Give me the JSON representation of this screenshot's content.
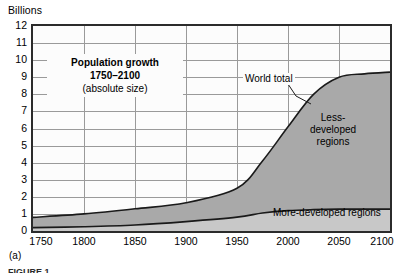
{
  "figure": {
    "unit_label": "Billions",
    "subfigure_label": "(a)",
    "cut_caption": "FIGURE 1"
  },
  "chart_data": {
    "type": "area",
    "title": "Population growth 1750–2100 (absolute size)",
    "title_lines": [
      "Population growth",
      "1750–2100",
      "(absolute size)"
    ],
    "xlabel": "",
    "ylabel": "Billions",
    "xlim": [
      1750,
      2100
    ],
    "ylim": [
      0,
      12
    ],
    "xticks": [
      1750,
      1800,
      1850,
      1900,
      1950,
      2000,
      2050,
      2100
    ],
    "yticks": [
      0,
      1,
      2,
      3,
      4,
      5,
      6,
      7,
      8,
      9,
      10,
      11,
      12
    ],
    "grid": true,
    "legend_position": "inline-annotations",
    "annotations": [
      {
        "name": "world-total",
        "text": "World total",
        "points_to_year": 1995
      },
      {
        "name": "less-developed",
        "text": "Less-developed regions",
        "lines": [
          "Less-",
          "developed",
          "regions"
        ]
      },
      {
        "name": "more-developed",
        "text": "More-developed regions"
      }
    ],
    "x": [
      1750,
      1800,
      1850,
      1900,
      1950,
      1975,
      2000,
      2025,
      2050,
      2075,
      2100
    ],
    "series": [
      {
        "name": "World total",
        "stacked": true,
        "color": "#b0b0b0",
        "values": [
          0.8,
          1.0,
          1.3,
          1.65,
          2.5,
          4.1,
          6.1,
          8.0,
          9.0,
          9.2,
          9.3
        ]
      },
      {
        "name": "More-developed regions",
        "stacked": true,
        "color": "#c4c4c4",
        "values": [
          0.2,
          0.25,
          0.35,
          0.55,
          0.81,
          1.05,
          1.19,
          1.25,
          1.28,
          1.28,
          1.28
        ]
      },
      {
        "name": "Less-developed regions",
        "derived": "world_total_minus_more_developed",
        "color": "#a8a8a8",
        "values": [
          0.6,
          0.75,
          0.95,
          1.1,
          1.69,
          3.05,
          4.91,
          6.75,
          7.72,
          7.92,
          8.02
        ]
      }
    ],
    "colors": {
      "less_developed_fill": "#a9a9a9",
      "more_developed_fill": "#c8c8c8",
      "curve_line": "#1a1a1a",
      "gridline": "#9a9a9a",
      "frame": "#2b2b2b",
      "plot_background": "#fcfcfc"
    }
  }
}
